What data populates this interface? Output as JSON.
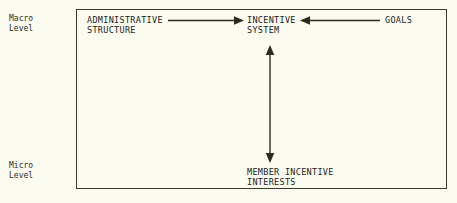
{
  "figure": {
    "background_color": "#fbfbf0",
    "line_color": "#2b2b20",
    "frame_border_color": "#3a3a2c"
  },
  "axis": {
    "macro_label_line1": "Macro",
    "macro_label_line2": "Level",
    "micro_label_line1": "Micro",
    "micro_label_line2": "Level"
  },
  "nodes": {
    "administrative_structure": "ADMINISTRATIVE\nSTRUCTURE",
    "incentive_system": "INCENTIVE\nSYSTEM",
    "goals": "GOALS",
    "member_incentive_interests": "MEMBER INCENTIVE\nINTERESTS"
  },
  "edges": [
    {
      "name": "administrative-structure-to-incentive-system",
      "from": "ADMINISTRATIVE STRUCTURE",
      "to": "INCENTIVE SYSTEM",
      "direction": "right",
      "arrowheads": 1
    },
    {
      "name": "goals-to-incentive-system",
      "from": "GOALS",
      "to": "INCENTIVE SYSTEM",
      "direction": "left",
      "arrowheads": 1
    },
    {
      "name": "incentive-system-to-member-incentive-interests",
      "from": "INCENTIVE SYSTEM",
      "to": "MEMBER INCENTIVE INTERESTS",
      "direction": "both",
      "arrowheads": 2
    }
  ]
}
